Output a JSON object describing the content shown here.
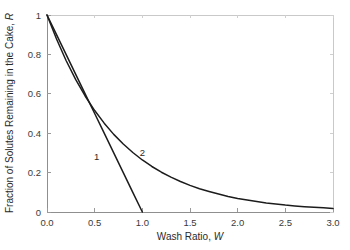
{
  "chart_data": {
    "type": "line",
    "title": "",
    "subtitle": "",
    "xlabel_text": "Wash Ratio, ",
    "xlabel_symbol": "W",
    "ylabel_text": "Fraction of Solutes Remaining in the Cake, ",
    "ylabel_symbol": "R",
    "xlim": [
      0.0,
      3.0
    ],
    "ylim": [
      0.0,
      1.0
    ],
    "xticks": [
      "0.0",
      "0.5",
      "1.0",
      "1.5",
      "2.0",
      "2.5",
      "3.0"
    ],
    "xtick_values": [
      0.0,
      0.5,
      1.0,
      1.5,
      2.0,
      2.5,
      3.0
    ],
    "yticks": [
      "0",
      "0.2",
      "0.4",
      "0.6",
      "0.8",
      "1"
    ],
    "ytick_values": [
      0.0,
      0.2,
      0.4,
      0.6,
      0.8,
      1.0
    ],
    "grid": false,
    "legend_position": "inline-curve-labels",
    "background_color": "#ffffff",
    "curve_color": "#1c1c1c",
    "frame_color": "#c9c9c9",
    "annotations": [
      {
        "text": "1",
        "x": 0.52,
        "y": 0.265,
        "describes": "series-1"
      },
      {
        "text": "2",
        "x": 1.0,
        "y": 0.285,
        "describes": "series-2"
      }
    ],
    "series": [
      {
        "name": "1",
        "label": "1",
        "description": "Ideal plug-flow displacement washing, straight line from R=1 at W=0 to R=0 at W=1",
        "x": [
          0.0,
          0.1,
          0.2,
          0.3,
          0.4,
          0.5,
          0.6,
          0.7,
          0.8,
          0.9,
          1.0
        ],
        "values": [
          1.0,
          0.9,
          0.8,
          0.7,
          0.6,
          0.5,
          0.4,
          0.3,
          0.2,
          0.1,
          0.0
        ]
      },
      {
        "name": "2",
        "label": "2",
        "description": "Exponential washing curve, R decays asymptotically toward 0",
        "x": [
          0.0,
          0.1,
          0.2,
          0.3,
          0.4,
          0.5,
          0.6,
          0.7,
          0.8,
          0.9,
          1.0,
          1.1,
          1.2,
          1.3,
          1.4,
          1.5,
          1.6,
          1.7,
          1.8,
          1.9,
          2.0,
          2.1,
          2.2,
          2.3,
          2.4,
          2.5,
          2.6,
          2.7,
          2.8,
          2.9,
          3.0
        ],
        "values": [
          1.0,
          0.878,
          0.769,
          0.673,
          0.589,
          0.515,
          0.451,
          0.394,
          0.345,
          0.302,
          0.264,
          0.231,
          0.202,
          0.177,
          0.155,
          0.135,
          0.118,
          0.104,
          0.091,
          0.079,
          0.069,
          0.061,
          0.053,
          0.046,
          0.041,
          0.035,
          0.031,
          0.027,
          0.024,
          0.021,
          0.018
        ]
      }
    ]
  }
}
